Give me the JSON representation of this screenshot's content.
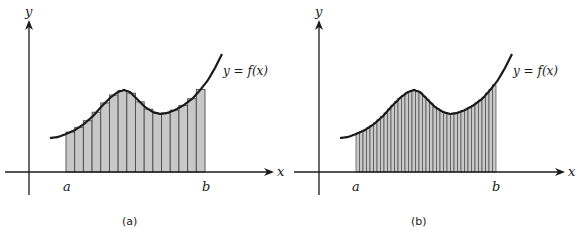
{
  "figure": {
    "panels": [
      {
        "id": "a",
        "caption": "(a)",
        "x_axis_label": "x",
        "y_axis_label": "y",
        "interval_start_label": "a",
        "interval_end_label": "b",
        "function_label": "y = f(x)",
        "num_rectangles": 16
      },
      {
        "id": "b",
        "caption": "(b)",
        "x_axis_label": "x",
        "y_axis_label": "y",
        "interval_start_label": "a",
        "interval_end_label": "b",
        "function_label": "y = f(x)",
        "num_rectangles": 40
      }
    ],
    "colors": {
      "axis": "#1a1a1a",
      "curve": "#1a1a1a",
      "rect_fill": "#c8c8c8",
      "rect_stroke": "#4a4a4a"
    }
  }
}
